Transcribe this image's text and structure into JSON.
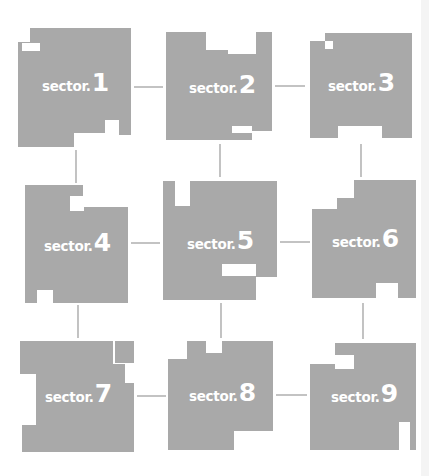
{
  "diagram": {
    "type": "sector-grid",
    "colors": {
      "fill": "#a9a9a9",
      "label": "#ffffff",
      "background": "#ffffff",
      "connector": "#a9a9a9"
    },
    "sectors": [
      {
        "id": 1,
        "prefix": "sector.",
        "number": "1"
      },
      {
        "id": 2,
        "prefix": "sector.",
        "number": "2"
      },
      {
        "id": 3,
        "prefix": "sector.",
        "number": "3"
      },
      {
        "id": 4,
        "prefix": "sector.",
        "number": "4"
      },
      {
        "id": 5,
        "prefix": "sector.",
        "number": "5"
      },
      {
        "id": 6,
        "prefix": "sector.",
        "number": "6"
      },
      {
        "id": 7,
        "prefix": "sector.",
        "number": "7"
      },
      {
        "id": 8,
        "prefix": "sector.",
        "number": "8"
      },
      {
        "id": 9,
        "prefix": "sector.",
        "number": "9"
      }
    ],
    "connections": [
      [
        "1",
        "2"
      ],
      [
        "2",
        "3"
      ],
      [
        "4",
        "5"
      ],
      [
        "5",
        "6"
      ],
      [
        "7",
        "8"
      ],
      [
        "8",
        "9"
      ],
      [
        "1",
        "4"
      ],
      [
        "4",
        "7"
      ],
      [
        "2",
        "5"
      ],
      [
        "5",
        "8"
      ],
      [
        "3",
        "6"
      ],
      [
        "6",
        "9"
      ]
    ]
  }
}
